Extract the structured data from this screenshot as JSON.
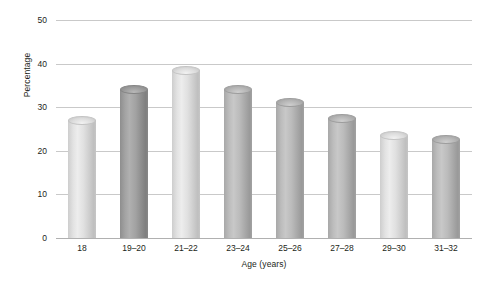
{
  "chart_data": {
    "type": "bar",
    "title": "",
    "xlabel": "Age (years)",
    "ylabel": "Percentage",
    "categories": [
      "18",
      "19–20",
      "21–22",
      "23–24",
      "25–26",
      "27–28",
      "29–30",
      "31–32"
    ],
    "values": [
      27,
      34,
      38.5,
      34,
      31,
      27.5,
      23.5,
      22.5
    ],
    "yticks": [
      0,
      10,
      20,
      30,
      40,
      50
    ],
    "ylim": [
      0,
      50
    ],
    "grid": true,
    "legend": "none",
    "bar_shading": [
      "light",
      "dark",
      "light",
      "medium",
      "medium",
      "medium",
      "light",
      "medium"
    ],
    "colors": {
      "gridline": "#c9c9c9",
      "axis": "#b0b0b0",
      "text": "#231f20",
      "bar_light": "#e2e2e2",
      "bar_medium": "#bcbcbc",
      "bar_dark": "#a3a3a3",
      "background": "#ffffff"
    }
  }
}
